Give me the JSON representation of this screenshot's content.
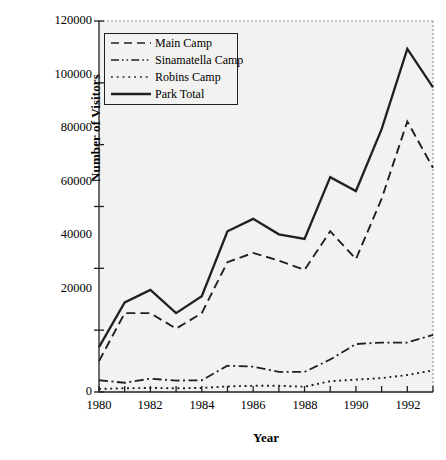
{
  "chart_data": {
    "type": "line",
    "title": "",
    "xlabel": "Year",
    "ylabel": "Number of Visitors",
    "x": [
      1980,
      1981,
      1982,
      1983,
      1984,
      1985,
      1986,
      1987,
      1988,
      1989,
      1990,
      1991,
      1992,
      1993
    ],
    "xtick_labels": [
      "1980",
      "",
      "1982",
      "",
      "1984",
      "",
      "1986",
      "",
      "1988",
      "",
      "1990",
      "",
      "1992",
      ""
    ],
    "xtick_labels_shown": [
      "1980",
      "1982",
      "1984",
      "1986",
      "1988",
      "1990",
      "1992"
    ],
    "ytick_labels": [
      "0",
      "20000",
      "40000",
      "60000",
      "80000",
      "100000",
      "120000"
    ],
    "ylim": [
      0,
      120000
    ],
    "xlim": [
      1980,
      1993
    ],
    "grid": false,
    "legend_position": "upper-left-inside",
    "series": [
      {
        "name": "Main Camp",
        "style": "dashed",
        "values": [
          10000,
          25500,
          25500,
          20500,
          25500,
          42000,
          45000,
          42500,
          39500,
          52000,
          43000,
          62500,
          87500,
          72500
        ]
      },
      {
        "name": "Sinamatella Camp",
        "style": "dash-dot",
        "values": [
          3800,
          3000,
          4300,
          3700,
          3800,
          8500,
          8200,
          6500,
          6500,
          10500,
          15500,
          16000,
          16000,
          18500
        ]
      },
      {
        "name": "Robins Camp",
        "style": "dotted",
        "values": [
          1000,
          1200,
          1300,
          1200,
          1300,
          1800,
          2000,
          2000,
          1700,
          3500,
          4000,
          4500,
          5500,
          7000
        ]
      },
      {
        "name": "Park Total",
        "style": "solid",
        "values": [
          14500,
          29000,
          33000,
          25500,
          31000,
          52000,
          56000,
          51000,
          49500,
          69500,
          65000,
          85000,
          111000,
          98500
        ]
      }
    ]
  },
  "legend": {
    "items": [
      {
        "label": "Main Camp",
        "style": "dashed"
      },
      {
        "label": "Sinamatella Camp",
        "style": "dash-dot"
      },
      {
        "label": "Robins Camp",
        "style": "dotted"
      },
      {
        "label": "Park Total",
        "style": "solid"
      }
    ]
  },
  "axes": {
    "y_label": "Number of Visitors",
    "x_label": "Year",
    "y_ticks": [
      "120000",
      "100000",
      "80000",
      "60000",
      "40000",
      "20000",
      "0"
    ],
    "x_ticks": [
      "1980",
      "1982",
      "1984",
      "1986",
      "1988",
      "1990",
      "1992"
    ]
  },
  "colors": {
    "line": "#231f20",
    "axis": "#231f20",
    "plot_background": "#f2f2f0",
    "page_background": "#ffffff"
  }
}
